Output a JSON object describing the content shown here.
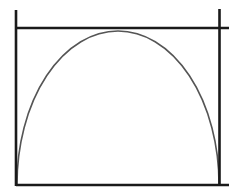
{
  "diagram": {
    "colors": {
      "background": "#ffffff",
      "frame": "#1a1a1a",
      "curve": "#555555"
    },
    "frame": {
      "left_line": {
        "x": 16,
        "y1": 10,
        "y2": 186
      },
      "right_line": {
        "x": 219.5,
        "y1": 9,
        "y2": 185
      },
      "top_line": {
        "y": 28,
        "x1": 16,
        "x2": 229
      },
      "bottom_line": {
        "y": 185,
        "x1": 16,
        "x2": 229
      }
    },
    "arch": {
      "start": {
        "x": 17,
        "y": 184
      },
      "apex": {
        "x": 118,
        "y": 31
      },
      "end": {
        "x": 219,
        "y": 184
      },
      "rx": 101,
      "ry": 153
    }
  }
}
